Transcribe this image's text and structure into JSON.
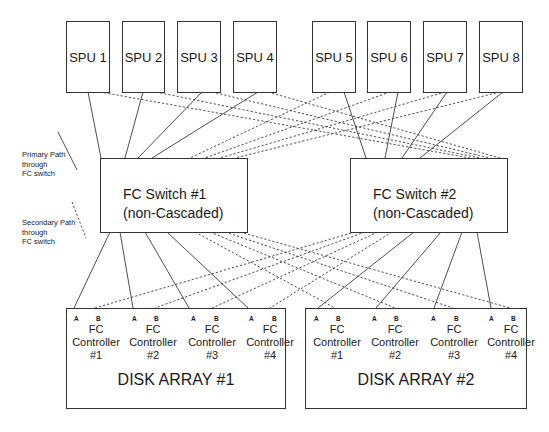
{
  "diagram": {
    "spus": [
      {
        "label": "SPU 1",
        "x": 66
      },
      {
        "label": "SPU 2",
        "x": 122
      },
      {
        "label": "SPU 3",
        "x": 177
      },
      {
        "label": "SPU 4",
        "x": 233
      },
      {
        "label": "SPU 5",
        "x": 312
      },
      {
        "label": "SPU 6",
        "x": 367
      },
      {
        "label": "SPU 7",
        "x": 423
      },
      {
        "label": "SPU 8",
        "x": 479
      }
    ],
    "switches": [
      {
        "line1": "FC Switch #1",
        "line2": "(non-Cascaded)"
      },
      {
        "line1": "FC Switch #2",
        "line2": "(non-Cascaded)"
      }
    ],
    "arrays": [
      {
        "title": "DISK ARRAY #1",
        "controllers": [
          {
            "line1": "FC",
            "line2": "Controller",
            "line3": "#1",
            "port_a": "A",
            "port_b": "B"
          },
          {
            "line1": "FC",
            "line2": "Controller",
            "line3": "#2",
            "port_a": "A",
            "port_b": "B"
          },
          {
            "line1": "FC",
            "line2": "Controller",
            "line3": "#3",
            "port_a": "A",
            "port_b": "B"
          },
          {
            "line1": "FC",
            "line2": "Controller",
            "line3": "#4",
            "port_a": "A",
            "port_b": "B"
          }
        ]
      },
      {
        "title": "DISK ARRAY #2",
        "controllers": [
          {
            "line1": "FC",
            "line2": "Controller",
            "line3": "#1",
            "port_a": "A",
            "port_b": "B"
          },
          {
            "line1": "FC",
            "line2": "Controller",
            "line3": "#2",
            "port_a": "A",
            "port_b": "B"
          },
          {
            "line1": "FC",
            "line2": "Controller",
            "line3": "#3",
            "port_a": "A",
            "port_b": "B"
          },
          {
            "line1": "FC",
            "line2": "Controller",
            "line3": "#4",
            "port_a": "A",
            "port_b": "B"
          }
        ]
      }
    ],
    "legend": {
      "primary": {
        "line1": "Primary Path",
        "line2": "through",
        "line3": "FC switch"
      },
      "secondary": {
        "line1": "Secondary Path",
        "line2": "through",
        "line3": "FC switch"
      }
    },
    "colors": {
      "line": "#333333",
      "background": "#ffffff"
    }
  }
}
